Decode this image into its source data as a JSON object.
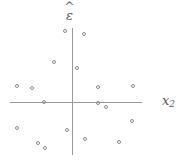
{
  "chart_data": {
    "type": "scatter",
    "title": "",
    "subtitle": "",
    "xlabel": "x2",
    "ylabel": "ε̂",
    "xlabel_base": "x",
    "xlabel_sub": "2",
    "ylabel_base": "ε",
    "ylabel_hat": "^",
    "grid": false,
    "legend": null,
    "axes_style": "crossed-at-origin",
    "origin_px": {
      "x": 72,
      "y": 102
    },
    "x_axis_extent_px": {
      "from": 10,
      "to": 142,
      "y": 102
    },
    "y_axis_extent_px": {
      "from": 28,
      "to": 155,
      "x": 72
    },
    "point_count": 18,
    "point_style": {
      "marker": "open-circle",
      "size_px": 4,
      "color": "#8d8d8d"
    },
    "xlim": [
      -62,
      70
    ],
    "ylim": [
      -53,
      74
    ],
    "points_px": [
      {
        "x": 65,
        "y": 31
      },
      {
        "x": 84,
        "y": 34
      },
      {
        "x": 54,
        "y": 62
      },
      {
        "x": 77,
        "y": 68
      },
      {
        "x": 17,
        "y": 86
      },
      {
        "x": 32,
        "y": 88
      },
      {
        "x": 98,
        "y": 87
      },
      {
        "x": 133,
        "y": 86
      },
      {
        "x": 44,
        "y": 102
      },
      {
        "x": 98,
        "y": 103
      },
      {
        "x": 106,
        "y": 107
      },
      {
        "x": 132,
        "y": 121
      },
      {
        "x": 17,
        "y": 128
      },
      {
        "x": 67,
        "y": 130
      },
      {
        "x": 85,
        "y": 139
      },
      {
        "x": 38,
        "y": 143
      },
      {
        "x": 119,
        "y": 142
      },
      {
        "x": 45,
        "y": 148
      }
    ],
    "x": [
      -7,
      12,
      -18,
      5,
      -55,
      -40,
      26,
      61,
      -28,
      26,
      34,
      60,
      -55,
      -5,
      13,
      -34,
      47,
      -27
    ],
    "y": [
      71,
      68,
      40,
      34,
      16,
      14,
      15,
      16,
      0,
      -1,
      -5,
      -19,
      -26,
      -28,
      -37,
      -41,
      -40,
      -46
    ],
    "colors": {
      "axis": "#9a9a9a",
      "marker_stroke": "#8d8d8d",
      "label_text": "#5a5a5a",
      "background": "#ffffff"
    }
  }
}
